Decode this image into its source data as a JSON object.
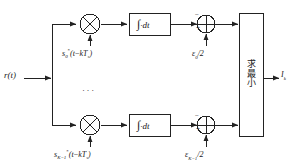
{
  "figure": {
    "type": "block-diagram",
    "background": "#ffffff",
    "line_color": "#222222"
  },
  "input": {
    "label": "r(t)",
    "name": "received-signal"
  },
  "branches": [
    {
      "id": "branch-0",
      "multiplier_symbol": "×",
      "reference_signal": "s*0(t−kTs)",
      "reference_signal_parts": {
        "base": "s",
        "sub": "0",
        "star": "*",
        "arg": "(t−kT",
        "arg_sub": "s",
        "arg_end": ")"
      },
      "integrator_label": "∫·dt",
      "adder_symbol": "⊕",
      "adder_sign_top": "−",
      "adder_sign_bottom": "+",
      "bias_label": "ε0/2",
      "bias_parts": {
        "base": "ε",
        "sub": "0",
        "tail": "/2"
      }
    },
    {
      "id": "branch-K-1",
      "multiplier_symbol": "×",
      "reference_signal": "s*K−1(t−kTs)",
      "reference_signal_parts": {
        "base": "s",
        "sub": "K−1",
        "star": "*",
        "arg": "(t−kT",
        "arg_sub": "s",
        "arg_end": ")"
      },
      "integrator_label": "∫·dt",
      "adder_symbol": "⊕",
      "adder_sign_top": "−",
      "adder_sign_bottom": "+",
      "bias_label": "εK−1/2",
      "bias_parts": {
        "base": "ε",
        "sub": "K−1",
        "tail": "/2"
      }
    }
  ],
  "vertical_ellipsis": "···",
  "decision_block": {
    "text": "求最小",
    "chars": [
      "求",
      "最",
      "小"
    ],
    "meaning_label": "find-minimum"
  },
  "output": {
    "label": "Ik",
    "base": "I",
    "sub": "k"
  }
}
